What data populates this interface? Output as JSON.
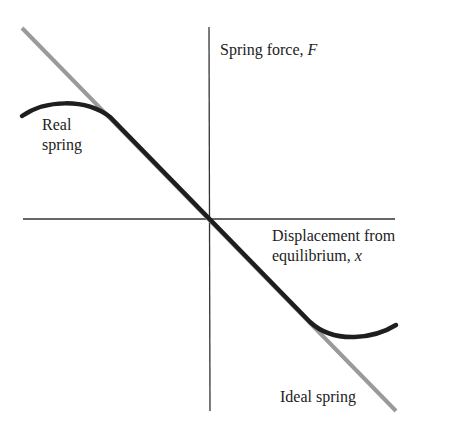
{
  "labels": {
    "y_axis": "Spring force, ",
    "y_axis_var": "F",
    "x_axis_line1": "Displacement from",
    "x_axis_line2": "equilibrium, ",
    "x_axis_var": "x",
    "real_spring_line1": "Real",
    "real_spring_line2": "spring",
    "ideal_spring": "Ideal spring"
  },
  "colors": {
    "axis": "#333333",
    "ideal_line": "#9a9a9a",
    "real_curve": "#1e1e1e"
  }
}
